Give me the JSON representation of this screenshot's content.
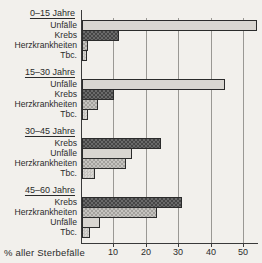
{
  "chart_data": {
    "type": "bar",
    "orientation": "horizontal",
    "title": "",
    "xlabel": "% aller Sterbefälle",
    "ylabel": "",
    "xlim": [
      0,
      55
    ],
    "grid": true,
    "x_ticks": [
      "10",
      "20",
      "30",
      "40",
      "50"
    ],
    "groups": [
      {
        "title": "0–15 Jahre",
        "bars": [
          {
            "label": "Unfälle",
            "value": 54,
            "style": "light"
          },
          {
            "label": "Krebs",
            "value": 11.5,
            "style": "dark-check"
          },
          {
            "label": "Herzkrankheiten",
            "value": 2,
            "style": "mid-check"
          },
          {
            "label": "Tbc.",
            "value": 1.5,
            "style": "light-check"
          }
        ]
      },
      {
        "title": "15–30 Jahre",
        "bars": [
          {
            "label": "Unfälle",
            "value": 44,
            "style": "light"
          },
          {
            "label": "Krebs",
            "value": 10,
            "style": "dark-check"
          },
          {
            "label": "Herzkrankheiten",
            "value": 4.8,
            "style": "mid-check"
          },
          {
            "label": "Tbc.",
            "value": 2,
            "style": "light-check"
          }
        ]
      },
      {
        "title": "30–45 Jahre",
        "bars": [
          {
            "label": "Krebs",
            "value": 24.5,
            "style": "dark-check"
          },
          {
            "label": "Unfälle",
            "value": 15.5,
            "style": "light"
          },
          {
            "label": "Herzkrankheiten",
            "value": 13.5,
            "style": "mid-check"
          },
          {
            "label": "Tbc.",
            "value": 4,
            "style": "light-check"
          }
        ]
      },
      {
        "title": "45–60 Jahre",
        "bars": [
          {
            "label": "Krebs",
            "value": 31,
            "style": "dark-check"
          },
          {
            "label": "Herzkrankheiten",
            "value": 23,
            "style": "mid-check"
          },
          {
            "label": "Unfälle",
            "value": 5.5,
            "style": "light"
          },
          {
            "label": "Tbc.",
            "value": 2.5,
            "style": "light-check"
          }
        ]
      }
    ]
  },
  "colors": {
    "background": "#f2f0ec",
    "bar_light": "#d9d6d1",
    "bar_dark": "#454545",
    "bar_mid": "#a3a19d",
    "bar_light_check": "#c5c3bf",
    "outline": "#2b2b2b",
    "grid": "#9a9894",
    "axis": "#3a3a3a"
  }
}
